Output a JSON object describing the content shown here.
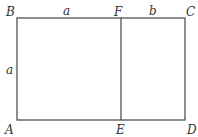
{
  "diagram": {
    "points": {
      "A": "A",
      "B": "B",
      "C": "C",
      "D": "D",
      "E": "E",
      "F": "F"
    },
    "segments": {
      "top_left": "a",
      "top_right": "b",
      "left_side": "a"
    },
    "line_color": "#444444",
    "label_color": "#333333"
  }
}
